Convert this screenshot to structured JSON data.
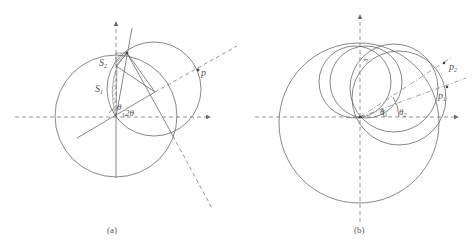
{
  "figure_a": {
    "caption": "(a)",
    "labels": {
      "s1": "S",
      "s1_sub": "1",
      "s2": "S",
      "s2_sub": "2",
      "theta": "θ",
      "two_theta": "2θ",
      "p": "p"
    }
  },
  "figure_b": {
    "caption": "(b)",
    "labels": {
      "s": "S",
      "p1": "p",
      "p1_sub": "1",
      "p2": "p",
      "p2_sub": "2",
      "theta1": "θ",
      "theta1_sub": "1",
      "theta2": "θ",
      "theta2_sub": "2"
    }
  },
  "colors": {
    "line": "#6a6a6a",
    "text": "#555555",
    "background": "#ffffff"
  }
}
